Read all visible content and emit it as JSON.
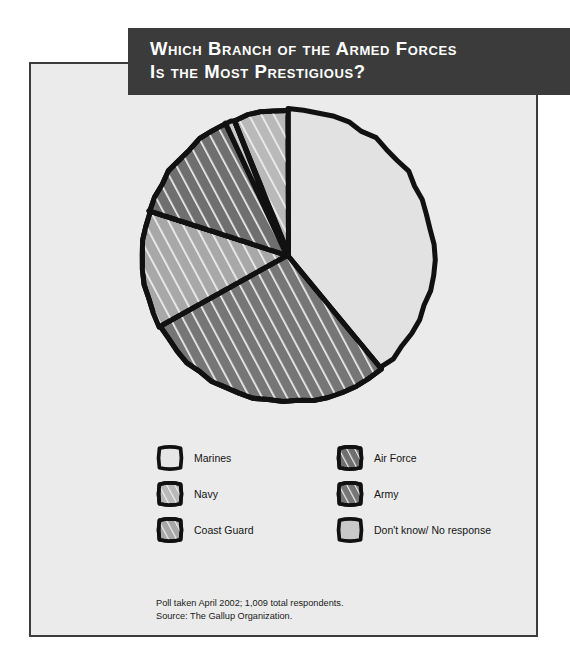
{
  "title": {
    "line1": "Which Branch of the Armed Forces",
    "line2": "Is the Most Prestigious?"
  },
  "colors": {
    "banner_bg": "#3b3b3b",
    "panel_bg": "#ebebeb",
    "outline": "#111111",
    "marines": "#e2e2e2",
    "navy": "#b9b9b9",
    "coast_guard": "#a8a8a8",
    "air_force": "#6f6f6f",
    "army": "#767676",
    "dont_know": "#c9c9c9"
  },
  "legend": {
    "rows": [
      [
        {
          "label": "Marines",
          "swatch": "marines-swatch"
        },
        {
          "label": "Air Force",
          "swatch": "air-force-swatch"
        }
      ],
      [
        {
          "label": "Navy",
          "swatch": "navy-swatch"
        },
        {
          "label": "Army",
          "swatch": "army-swatch"
        }
      ],
      [
        {
          "label": "Coast Guard",
          "swatch": "coast-guard-swatch"
        },
        {
          "label": "Don't know/ No response",
          "swatch": "dont-know-swatch"
        }
      ]
    ]
  },
  "source": {
    "line1": "Poll taken April 2002; 1,009 total respondents.",
    "line2": "Source: The Gallup Organization."
  },
  "chart_data": {
    "type": "pie",
    "title": "Which Branch of the Armed Forces Is the Most Prestigious?",
    "unit": "percent",
    "start_angle_deg": 0,
    "direction": "clockwise",
    "total": 100,
    "categories": [
      "Marines",
      "Army",
      "Coast Guard",
      "Air Force",
      "Don't know/ No response",
      "Navy"
    ],
    "values": [
      39,
      28,
      13,
      13,
      1,
      6
    ],
    "labels": [
      "39%",
      "28%",
      "13%",
      "13%",
      "1%",
      "6%"
    ],
    "slices": [
      {
        "name": "Marines",
        "value": 39,
        "label": "39%",
        "color": "#e2e2e2",
        "hatched": false
      },
      {
        "name": "Army",
        "value": 28,
        "label": "28%",
        "color": "#767676",
        "hatched": true
      },
      {
        "name": "Coast Guard",
        "value": 13,
        "label": "13%",
        "color": "#a8a8a8",
        "hatched": true
      },
      {
        "name": "Air Force",
        "value": 13,
        "label": "13%",
        "color": "#6f6f6f",
        "hatched": true
      },
      {
        "name": "Don't know/ No response",
        "value": 1,
        "label": "1%",
        "color": "#c9c9c9",
        "hatched": false
      },
      {
        "name": "Navy",
        "value": 6,
        "label": "6%",
        "color": "#b9b9b9",
        "hatched": true
      }
    ],
    "legend_position": "below",
    "grid": false
  }
}
